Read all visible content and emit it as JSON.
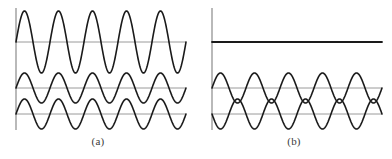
{
  "figure": {
    "width": 392,
    "height": 159,
    "background_color": "#ffffff",
    "axis_color": "#8a8a8a",
    "baseline_color": "#9a9a9a",
    "wave_color": "#1a1a1a"
  },
  "panels": [
    {
      "id": "a",
      "caption": "(a)",
      "axis": {
        "x": 16,
        "y_top": 8,
        "y_bottom": 130
      },
      "waves": [
        {
          "name": "resultant-wave",
          "role": "resultant",
          "baseline_y": 42,
          "amplitude": 31,
          "cycles": 5,
          "phase_deg": 0,
          "x_start": 16,
          "x_end": 186,
          "stroke_width": 1.6,
          "baseline_visible": true
        },
        {
          "name": "component-wave-1",
          "role": "component",
          "baseline_y": 88,
          "amplitude": 15,
          "cycles": 5,
          "phase_deg": 0,
          "x_start": 16,
          "x_end": 186,
          "stroke_width": 1.6,
          "baseline_visible": true
        },
        {
          "name": "component-wave-2",
          "role": "component",
          "baseline_y": 114,
          "amplitude": 15,
          "cycles": 5,
          "phase_deg": 0,
          "x_start": 16,
          "x_end": 186,
          "stroke_width": 1.6,
          "baseline_visible": true
        }
      ]
    },
    {
      "id": "b",
      "caption": "(b)",
      "axis": {
        "x": 16,
        "y_top": 8,
        "y_bottom": 130
      },
      "waves": [
        {
          "name": "resultant-wave",
          "role": "resultant",
          "baseline_y": 42,
          "amplitude": 0,
          "cycles": 5,
          "phase_deg": 0,
          "x_start": 16,
          "x_end": 186,
          "stroke_width": 1.8,
          "baseline_visible": false
        },
        {
          "name": "component-wave-1",
          "role": "component",
          "baseline_y": 88,
          "amplitude": 15,
          "cycles": 5,
          "phase_deg": 0,
          "x_start": 16,
          "x_end": 186,
          "stroke_width": 1.6,
          "baseline_visible": true
        },
        {
          "name": "component-wave-2",
          "role": "component",
          "baseline_y": 114,
          "amplitude": 15,
          "cycles": 5,
          "phase_deg": 180,
          "x_start": 16,
          "x_end": 186,
          "stroke_width": 1.6,
          "baseline_visible": true
        }
      ]
    }
  ],
  "chart_data": {
    "type": "line",
    "title": "",
    "xlabel": "",
    "ylabel": "",
    "grid": false,
    "legend_position": "none",
    "panels": [
      {
        "label": "(a)",
        "description": "Constructive interference: two identical in-phase waves sum to a wave of doubled amplitude.",
        "x_range": [
          0,
          5
        ],
        "series": [
          {
            "name": "resultant",
            "function": "y = 2A sin(2*pi*5*x)",
            "amplitude": 2,
            "cycles": 5,
            "phase_deg": 0,
            "baseline": 0
          },
          {
            "name": "component 1",
            "function": "y = A sin(2*pi*5*x)",
            "amplitude": 1,
            "cycles": 5,
            "phase_deg": 0,
            "baseline": 0
          },
          {
            "name": "component 2",
            "function": "y = A sin(2*pi*5*x)",
            "amplitude": 1,
            "cycles": 5,
            "phase_deg": 0,
            "baseline": 0
          }
        ]
      },
      {
        "label": "(b)",
        "description": "Destructive interference: two identical waves 180 degrees out of phase sum to zero.",
        "x_range": [
          0,
          5
        ],
        "series": [
          {
            "name": "resultant",
            "function": "y = 0",
            "amplitude": 0,
            "cycles": 5,
            "phase_deg": 0,
            "baseline": 0
          },
          {
            "name": "component 1",
            "function": "y = A sin(2*pi*5*x)",
            "amplitude": 1,
            "cycles": 5,
            "phase_deg": 0,
            "baseline": 0
          },
          {
            "name": "component 2",
            "function": "y = A sin(2*pi*5*x + pi)",
            "amplitude": 1,
            "cycles": 5,
            "phase_deg": 180,
            "baseline": 0
          }
        ]
      }
    ]
  }
}
